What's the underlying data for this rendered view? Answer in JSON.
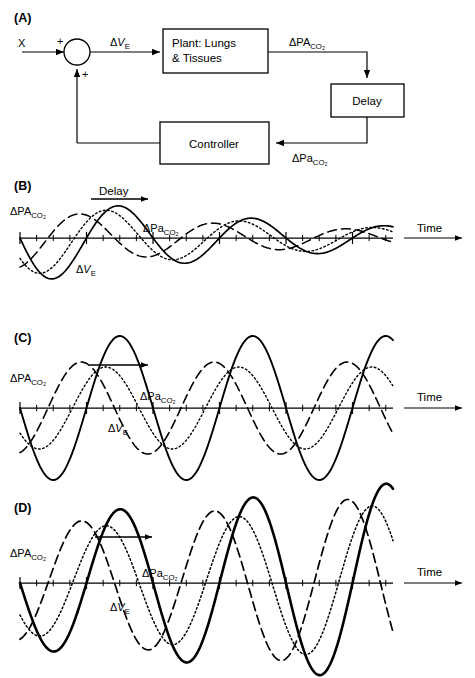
{
  "figure": {
    "width": 475,
    "height": 678,
    "background": "#ffffff",
    "stroke_color": "#000000"
  },
  "panels": {
    "a": {
      "label": "(A)",
      "type": "block-diagram",
      "input_label": "X",
      "plus_sign_top": "+",
      "plus_sign_bottom": "+",
      "blocks": [
        {
          "name": "plant",
          "line1": "Plant: Lungs",
          "line2": "& Tissues"
        },
        {
          "name": "delay",
          "line1": "Delay"
        },
        {
          "name": "controller",
          "line1": "Controller"
        }
      ],
      "signals": {
        "ve": {
          "delta": "Δ",
          "main": "V",
          "sub": "E"
        },
        "paco2_alveolar": {
          "delta": "Δ",
          "main": "PA",
          "sub": "CO2"
        },
        "paco2_arterial": {
          "delta": "Δ",
          "main": "Pa",
          "sub": "CO2"
        }
      }
    },
    "b": {
      "label": "(B)",
      "caption_delay": "Delay",
      "time_label": "Time",
      "axis_label_alveolar": {
        "delta": "Δ",
        "main": "PA",
        "sub": "CO2"
      },
      "axis_label_arterial": {
        "delta": "Δ",
        "main": "Pa",
        "sub": "CO2"
      },
      "axis_label_ventilation": {
        "delta": "Δ",
        "main": "V",
        "sub": "E"
      }
    },
    "c": {
      "label": "(C)",
      "time_label": "Time",
      "axis_label_alveolar": {
        "delta": "Δ",
        "main": "PA",
        "sub": "CO2"
      },
      "axis_label_arterial": {
        "delta": "Δ",
        "main": "Pa",
        "sub": "CO2"
      },
      "axis_label_ventilation": {
        "delta": "Δ",
        "main": "V",
        "sub": "E"
      }
    },
    "d": {
      "label": "(D)",
      "time_label": "Time",
      "axis_label_alveolar": {
        "delta": "Δ",
        "main": "PA",
        "sub": "CO2"
      },
      "axis_label_arterial": {
        "delta": "Δ",
        "main": "Pa",
        "sub": "CO2"
      },
      "axis_label_ventilation": {
        "delta": "Δ",
        "main": "V",
        "sub": "E"
      }
    }
  },
  "chart_data": [
    {
      "id": "panel-b",
      "type": "line",
      "title": "(B) Damped oscillation",
      "xlabel": "Time",
      "ylabel": "",
      "x_start": 20,
      "x_end": 393,
      "baseline_y": 238,
      "period_px": 133,
      "grid": false,
      "legend": "inline-annotations",
      "annotation": "Delay",
      "series": [
        {
          "name": "ΔVE",
          "style": "solid",
          "linewidth": 1.7,
          "amplitude": 46,
          "damping": 0.52,
          "phase_deg": 180,
          "phase_shift_px": 0
        },
        {
          "name": "ΔPACO2",
          "style": "dashed",
          "linewidth": 1.5,
          "amplitude": 30,
          "damping": 0.52,
          "phase_deg": 0,
          "phase_shift_px": -28
        },
        {
          "name": "ΔPaCO2",
          "style": "dotted",
          "linewidth": 1.4,
          "amplitude": 38,
          "damping": 0.52,
          "phase_deg": 180,
          "phase_shift_px": 12
        }
      ]
    },
    {
      "id": "panel-c",
      "type": "line",
      "title": "(C) Sustained oscillation",
      "xlabel": "Time",
      "ylabel": "",
      "x_start": 20,
      "x_end": 393,
      "baseline_y": 408,
      "period_px": 133,
      "grid": false,
      "legend": "inline-annotations",
      "annotation": "delay-arrow",
      "series": [
        {
          "name": "ΔVE",
          "style": "solid",
          "linewidth": 1.9,
          "amplitude": 72,
          "damping": 0,
          "phase_deg": 180,
          "phase_shift_px": 0
        },
        {
          "name": "ΔPACO2",
          "style": "dashed",
          "linewidth": 1.6,
          "amplitude": 46,
          "damping": 0,
          "phase_deg": 0,
          "phase_shift_px": -28
        },
        {
          "name": "ΔPaCO2",
          "style": "dotted",
          "linewidth": 1.4,
          "amplitude": 41,
          "damping": 0,
          "phase_deg": 180,
          "phase_shift_px": 14
        }
      ]
    },
    {
      "id": "panel-d",
      "type": "line",
      "title": "(D) Growing oscillation",
      "xlabel": "Time",
      "ylabel": "",
      "x_start": 20,
      "x_end": 393,
      "baseline_y": 583,
      "period_px": 133,
      "grid": false,
      "legend": "inline-annotations",
      "annotation": "delay-arrow",
      "series": [
        {
          "name": "ΔVE",
          "style": "solid",
          "linewidth": 2.6,
          "amplitude": 66,
          "damping": -0.16,
          "phase_deg": 180,
          "phase_shift_px": 0
        },
        {
          "name": "ΔPACO2",
          "style": "dashed",
          "linewidth": 1.7,
          "amplitude": 58,
          "damping": -0.16,
          "phase_deg": 0,
          "phase_shift_px": -28
        },
        {
          "name": "ΔPaCO2",
          "style": "dotted",
          "linewidth": 1.5,
          "amplitude": 52,
          "damping": -0.16,
          "phase_deg": 180,
          "phase_shift_px": 14
        }
      ]
    }
  ]
}
